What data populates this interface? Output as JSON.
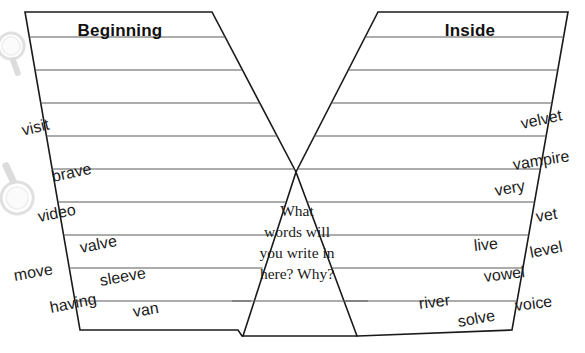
{
  "worksheet": {
    "title": "V Diagram Word Sort",
    "canvas": {
      "width": 585,
      "height": 353
    },
    "prompt_lines": [
      "What",
      "words will",
      "you write in",
      "here? Why?"
    ],
    "left_arm": {
      "label": "Beginning",
      "label_x": 120,
      "label_y": 24,
      "outline": "25,12 212,12 288,164 296,172 288,180 239,336 243,336 238,330 80,330",
      "rule_rows": 9
    },
    "right_arm": {
      "label": "Inside",
      "label_x": 470,
      "label_y": 24,
      "outline": "378,12 568,12 512,330 358,330 304,180 296,172 304,164",
      "rule_rows": 9
    },
    "rule_y_positions": [
      37,
      70,
      103,
      136,
      169,
      202,
      235,
      268,
      301
    ],
    "base_y": 336,
    "center_prompt": {
      "x": 297,
      "start_y": 216,
      "line_height": 21
    },
    "word_bank": {
      "left_words": [
        {
          "text": "visit",
          "x": 22,
          "y": 122,
          "rotate": -14,
          "size": 16
        },
        {
          "text": "brave",
          "x": 52,
          "y": 168,
          "rotate": -12,
          "size": 16
        },
        {
          "text": "video",
          "x": 38,
          "y": 208,
          "rotate": -11,
          "size": 16
        },
        {
          "text": "valve",
          "x": 80,
          "y": 239,
          "rotate": -11,
          "size": 16
        },
        {
          "text": "move",
          "x": 14,
          "y": 267,
          "rotate": -10,
          "size": 16
        },
        {
          "text": "sleeve",
          "x": 100,
          "y": 272,
          "rotate": -10,
          "size": 16
        },
        {
          "text": "having",
          "x": 50,
          "y": 299,
          "rotate": -11,
          "size": 16
        },
        {
          "text": "van",
          "x": 133,
          "y": 303,
          "rotate": -9,
          "size": 16
        }
      ],
      "right_words": [
        {
          "text": "velvet",
          "x": 521,
          "y": 115,
          "rotate": -12,
          "size": 16
        },
        {
          "text": "vampire",
          "x": 513,
          "y": 156,
          "rotate": -9,
          "size": 16
        },
        {
          "text": "very",
          "x": 495,
          "y": 182,
          "rotate": -10,
          "size": 16
        },
        {
          "text": "vet",
          "x": 536,
          "y": 208,
          "rotate": -9,
          "size": 16
        },
        {
          "text": "live",
          "x": 474,
          "y": 237,
          "rotate": -6,
          "size": 16
        },
        {
          "text": "level",
          "x": 530,
          "y": 244,
          "rotate": -11,
          "size": 16
        },
        {
          "text": "vowel",
          "x": 484,
          "y": 268,
          "rotate": -7,
          "size": 16
        },
        {
          "text": "river",
          "x": 419,
          "y": 295,
          "rotate": -7,
          "size": 16
        },
        {
          "text": "voice",
          "x": 515,
          "y": 297,
          "rotate": -7,
          "size": 16
        },
        {
          "text": "solve",
          "x": 458,
          "y": 313,
          "rotate": -10,
          "size": 16
        }
      ]
    },
    "watermarks": [
      {
        "name": "magnifier-watermark-top",
        "x": -12,
        "y": 28,
        "size": 52,
        "rotate": 25
      },
      {
        "name": "magnifier-watermark-bottom",
        "x": -18,
        "y": 158,
        "size": 62,
        "rotate": 200
      }
    ],
    "colors": {
      "outline": "#1a1a1a",
      "rule": "#5a5a5a",
      "text": "#1a1a1a",
      "background": "#ffffff"
    }
  }
}
